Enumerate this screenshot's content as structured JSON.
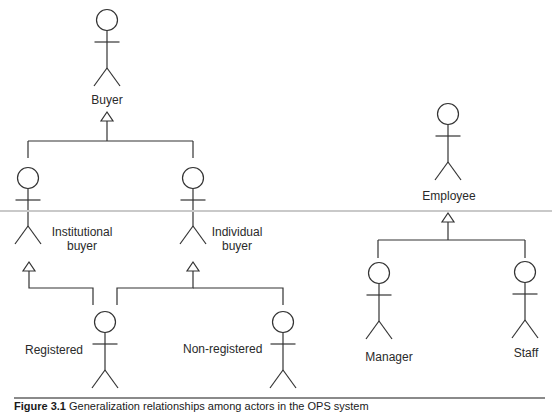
{
  "diagram": {
    "type": "UML use-case actor generalization",
    "actors": [
      {
        "id": "buyer",
        "label": "Buyer",
        "x": 107,
        "y": 20
      },
      {
        "id": "institutional",
        "label": "Institutional\nbuyer",
        "x": 28,
        "y": 178
      },
      {
        "id": "individual",
        "label": "Individual\nbuyer",
        "x": 193,
        "y": 178
      },
      {
        "id": "registered",
        "label": "Registered",
        "x": 105,
        "y": 322
      },
      {
        "id": "nonregistered",
        "label": "Non-registered",
        "x": 283,
        "y": 322
      },
      {
        "id": "employee",
        "label": "Employee",
        "x": 448,
        "y": 114
      },
      {
        "id": "manager",
        "label": "Manager",
        "x": 379,
        "y": 273
      },
      {
        "id": "staff",
        "label": "Staff",
        "x": 525,
        "y": 272
      }
    ],
    "generalizations": [
      {
        "child": "institutional",
        "parent": "buyer"
      },
      {
        "child": "individual",
        "parent": "buyer"
      },
      {
        "child": "registered",
        "parent": "institutional"
      },
      {
        "child": "registered",
        "parent": "individual"
      },
      {
        "child": "nonregistered",
        "parent": "individual"
      },
      {
        "child": "manager",
        "parent": "employee"
      },
      {
        "child": "staff",
        "parent": "employee"
      }
    ],
    "colors": {
      "stroke": "#333333",
      "scan_line": "#c9c9c9",
      "rule": "#8a8a8a"
    }
  },
  "caption": {
    "figure_number": "Figure 3.1",
    "text": " Generalization relationships among actors in the OPS system"
  }
}
